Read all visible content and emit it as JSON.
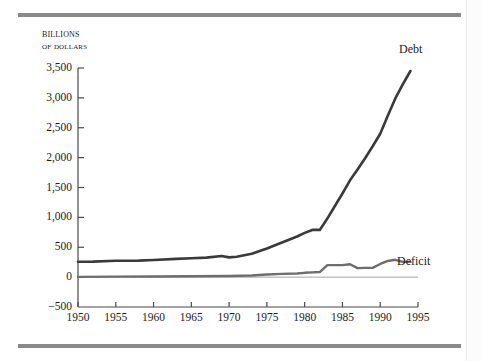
{
  "figure": {
    "axis_label_line1": "Billions",
    "axis_label_line2": "of dollars",
    "rule_color": "#8a8a8a",
    "line_color": "#3a3a3a",
    "axis_color": "#4a4a4a"
  },
  "chart_data": {
    "type": "line",
    "title": "",
    "subtitle": "",
    "xlabel": "",
    "ylabel": "Billions of dollars",
    "grid": false,
    "legend_position": "inline-end-of-line",
    "xlim": [
      1950,
      1995
    ],
    "ylim": [
      -500,
      3500
    ],
    "ytick_step": 500,
    "xtick_step": 5,
    "xticks": [
      1950,
      1955,
      1960,
      1965,
      1970,
      1975,
      1980,
      1985,
      1990,
      1995
    ],
    "xtick_labels": [
      "1950",
      "1955",
      "1960",
      "1965",
      "1970",
      "1975",
      "1980",
      "1985",
      "1990",
      "1995"
    ],
    "yticks": [
      -500,
      0,
      500,
      1000,
      1500,
      2000,
      2500,
      3000,
      3500
    ],
    "ytick_labels": [
      "−500",
      "0",
      "500",
      "1,000",
      "1,500",
      "2,000",
      "2,500",
      "3,000",
      "3,500"
    ],
    "series": [
      {
        "name": "Debt",
        "label": "Debt",
        "color": "#3a3a3a",
        "width": 2.6,
        "x": [
          1950,
          1952,
          1955,
          1958,
          1960,
          1963,
          1965,
          1967,
          1969,
          1970,
          1971,
          1973,
          1975,
          1977,
          1979,
          1980,
          1981,
          1982,
          1983,
          1984,
          1985,
          1986,
          1987,
          1988,
          1989,
          1990,
          1991,
          1992,
          1993,
          1994
        ],
        "values": [
          257,
          259,
          274,
          276,
          286,
          306,
          317,
          326,
          354,
          331,
          340,
          390,
          480,
          580,
          680,
          740,
          790,
          790,
          980,
          1190,
          1400,
          1620,
          1800,
          1990,
          2190,
          2400,
          2700,
          2990,
          3230,
          3450
        ]
      },
      {
        "name": "Deficit",
        "label": "Deficit",
        "color": "#6e6e6e",
        "width": 2.4,
        "x": [
          1950,
          1955,
          1960,
          1965,
          1970,
          1973,
          1975,
          1977,
          1979,
          1980,
          1981,
          1982,
          1983,
          1984,
          1985,
          1986,
          1987,
          1988,
          1989,
          1990,
          1991,
          1992,
          1993,
          1994
        ],
        "values": [
          5,
          8,
          10,
          15,
          20,
          28,
          45,
          55,
          60,
          72,
          80,
          85,
          200,
          200,
          200,
          215,
          150,
          155,
          155,
          220,
          270,
          290,
          255,
          255
        ]
      }
    ],
    "annotations": [
      {
        "text": "Debt",
        "series": "Debt",
        "near_x": 1994
      },
      {
        "text": "Deficit",
        "series": "Deficit",
        "near_x": 1993
      }
    ]
  }
}
